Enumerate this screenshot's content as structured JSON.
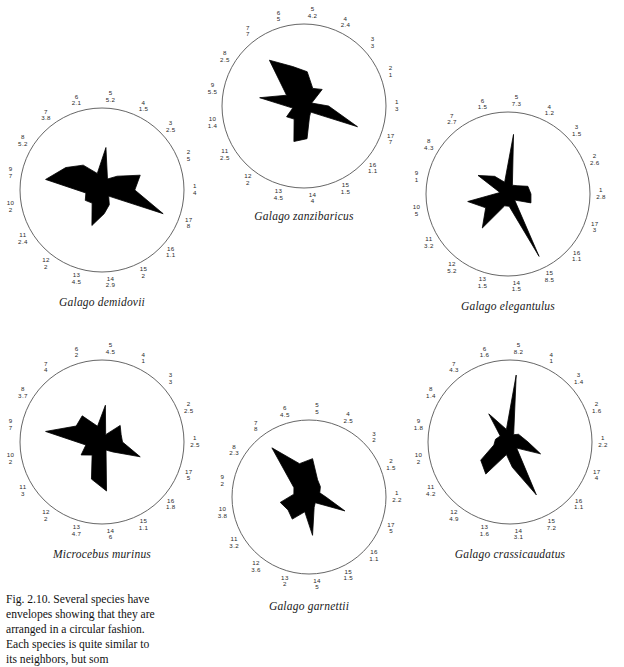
{
  "figure": {
    "caption": "Fig. 2.10. Several species have envelopes showing that they are arranged in a circular fashion. Each species is quite similar to its neighbors, but som"
  },
  "chart_data": [
    {
      "type": "radar",
      "title": "Galago demidovii",
      "spoke_count": 17,
      "rmax": 10,
      "categories": [
        "1",
        "2",
        "3",
        "4",
        "5",
        "6",
        "7",
        "8",
        "9",
        "10",
        "11",
        "12",
        "13",
        "14",
        "15",
        "16",
        "17"
      ],
      "values": [
        4,
        5,
        2.5,
        1.5,
        5.2,
        2.1,
        3.8,
        5.2,
        7,
        2,
        2.4,
        2,
        4.5,
        2.9,
        2,
        1.1,
        8
      ],
      "labels": [
        {
          "idx": "1",
          "val": "4"
        },
        {
          "idx": "2",
          "val": "5"
        },
        {
          "idx": "3",
          "val": "2.5"
        },
        {
          "idx": "4",
          "val": "1.5"
        },
        {
          "idx": "5",
          "val": "5.2"
        },
        {
          "idx": "6",
          "val": "2.1"
        },
        {
          "idx": "7",
          "val": "3.8"
        },
        {
          "idx": "8",
          "val": "5.2"
        },
        {
          "idx": "9",
          "val": "7"
        },
        {
          "idx": "10",
          "val": "2"
        },
        {
          "idx": "11",
          "val": "2.4"
        },
        {
          "idx": "12",
          "val": "2"
        },
        {
          "idx": "13",
          "val": "4.5"
        },
        {
          "idx": "14",
          "val": "2.9"
        },
        {
          "idx": "15",
          "val": "2"
        },
        {
          "idx": "16",
          "val": "1.1"
        },
        {
          "idx": "17",
          "val": "8"
        }
      ]
    },
    {
      "type": "radar",
      "title": "Galago zanzibaricus",
      "spoke_count": 17,
      "rmax": 10,
      "categories": [
        "1",
        "2",
        "3",
        "4",
        "5",
        "6",
        "7",
        "8",
        "9",
        "10",
        "11",
        "12",
        "13",
        "14",
        "15",
        "16",
        "17"
      ],
      "values": [
        3,
        1,
        3,
        2.4,
        4.2,
        5,
        7,
        2.5,
        5.5,
        1.4,
        2.5,
        2,
        4.5,
        4,
        1.5,
        1.1,
        7
      ],
      "labels": [
        {
          "idx": "1",
          "val": "3"
        },
        {
          "idx": "2",
          "val": "1"
        },
        {
          "idx": "3",
          "val": "3"
        },
        {
          "idx": "4",
          "val": "2.4"
        },
        {
          "idx": "5",
          "val": "4.2"
        },
        {
          "idx": "6",
          "val": "5"
        },
        {
          "idx": "7",
          "val": "7"
        },
        {
          "idx": "8",
          "val": "2.5"
        },
        {
          "idx": "9",
          "val": "5.5"
        },
        {
          "idx": "10",
          "val": "1.4"
        },
        {
          "idx": "11",
          "val": "2.5"
        },
        {
          "idx": "12",
          "val": "2"
        },
        {
          "idx": "13",
          "val": "4.5"
        },
        {
          "idx": "14",
          "val": "4"
        },
        {
          "idx": "15",
          "val": "1.5"
        },
        {
          "idx": "16",
          "val": "1.1"
        },
        {
          "idx": "17",
          "val": "7"
        }
      ]
    },
    {
      "type": "radar",
      "title": "Galago elegantulus",
      "spoke_count": 17,
      "rmax": 10,
      "categories": [
        "1",
        "2",
        "3",
        "4",
        "5",
        "6",
        "7",
        "8",
        "9",
        "10",
        "11",
        "12",
        "13",
        "14",
        "15",
        "16",
        "17"
      ],
      "values": [
        2.8,
        2.6,
        1.5,
        1.2,
        7.3,
        1.5,
        2.7,
        4.3,
        1,
        5,
        3.2,
        5.2,
        1.5,
        1.5,
        8.5,
        1.1,
        3
      ],
      "labels": [
        {
          "idx": "1",
          "val": "2.8"
        },
        {
          "idx": "2",
          "val": "2.6"
        },
        {
          "idx": "3",
          "val": "1.5"
        },
        {
          "idx": "4",
          "val": "1.2"
        },
        {
          "idx": "5",
          "val": "7.3"
        },
        {
          "idx": "6",
          "val": "1.5"
        },
        {
          "idx": "7",
          "val": "2.7"
        },
        {
          "idx": "8",
          "val": "4.3"
        },
        {
          "idx": "9",
          "val": "1"
        },
        {
          "idx": "10",
          "val": "5"
        },
        {
          "idx": "11",
          "val": "3.2"
        },
        {
          "idx": "12",
          "val": "5.2"
        },
        {
          "idx": "13",
          "val": "1.5"
        },
        {
          "idx": "14",
          "val": "1.5"
        },
        {
          "idx": "15",
          "val": "8.5"
        },
        {
          "idx": "16",
          "val": "1.1"
        },
        {
          "idx": "17",
          "val": "3"
        }
      ]
    },
    {
      "type": "radar",
      "title": "Microcebus murinus",
      "spoke_count": 17,
      "rmax": 10,
      "categories": [
        "1",
        "2",
        "3",
        "4",
        "5",
        "6",
        "7",
        "8",
        "9",
        "10",
        "11",
        "12",
        "13",
        "14",
        "15",
        "16",
        "17"
      ],
      "values": [
        2.5,
        2.5,
        3,
        1,
        4.5,
        2,
        4,
        3.7,
        7,
        2,
        3,
        2,
        4.7,
        6,
        1.1,
        1.8,
        5
      ],
      "labels": [
        {
          "idx": "1",
          "val": "2.5"
        },
        {
          "idx": "2",
          "val": "2.5"
        },
        {
          "idx": "3",
          "val": "3"
        },
        {
          "idx": "4",
          "val": "1"
        },
        {
          "idx": "5",
          "val": "4.5"
        },
        {
          "idx": "6",
          "val": "2"
        },
        {
          "idx": "7",
          "val": "4"
        },
        {
          "idx": "8",
          "val": "3.7"
        },
        {
          "idx": "9",
          "val": "7"
        },
        {
          "idx": "10",
          "val": "2"
        },
        {
          "idx": "11",
          "val": "3"
        },
        {
          "idx": "12",
          "val": "2"
        },
        {
          "idx": "13",
          "val": "4.7"
        },
        {
          "idx": "14",
          "val": "6"
        },
        {
          "idx": "15",
          "val": "1.1"
        },
        {
          "idx": "16",
          "val": "1.8"
        },
        {
          "idx": "17",
          "val": "5"
        }
      ]
    },
    {
      "type": "radar",
      "title": "Galago garnettii",
      "spoke_count": 17,
      "rmax": 10,
      "categories": [
        "1",
        "2",
        "3",
        "4",
        "5",
        "6",
        "7",
        "8",
        "9",
        "10",
        "11",
        "12",
        "13",
        "14",
        "15",
        "16",
        "17"
      ],
      "values": [
        2.2,
        1.5,
        2,
        2.5,
        5,
        4.5,
        8,
        2.3,
        2,
        3.8,
        3.2,
        3.6,
        2,
        5,
        1.5,
        1.1,
        5
      ],
      "labels": [
        {
          "idx": "1",
          "val": "2.2"
        },
        {
          "idx": "2",
          "val": "1.5"
        },
        {
          "idx": "3",
          "val": "2"
        },
        {
          "idx": "4",
          "val": "2.5"
        },
        {
          "idx": "5",
          "val": "5"
        },
        {
          "idx": "6",
          "val": "4.5"
        },
        {
          "idx": "7",
          "val": "8"
        },
        {
          "idx": "8",
          "val": "2.3"
        },
        {
          "idx": "9",
          "val": "2"
        },
        {
          "idx": "10",
          "val": "3.8"
        },
        {
          "idx": "11",
          "val": "3.2"
        },
        {
          "idx": "12",
          "val": "3.6"
        },
        {
          "idx": "13",
          "val": "2"
        },
        {
          "idx": "14",
          "val": "5"
        },
        {
          "idx": "15",
          "val": "1.5"
        },
        {
          "idx": "16",
          "val": "1.1"
        },
        {
          "idx": "17",
          "val": "5"
        }
      ]
    },
    {
      "type": "radar",
      "title": "Galago crassicaudatus",
      "spoke_count": 17,
      "rmax": 10,
      "categories": [
        "1",
        "2",
        "3",
        "4",
        "5",
        "6",
        "7",
        "8",
        "9",
        "10",
        "11",
        "12",
        "13",
        "14",
        "15",
        "16",
        "17"
      ],
      "values": [
        2.2,
        1.6,
        1.4,
        1,
        8.2,
        1.6,
        4.3,
        1.4,
        1.8,
        2,
        4.2,
        4.9,
        1.6,
        3.1,
        7.2,
        1.1,
        4
      ],
      "labels": [
        {
          "idx": "1",
          "val": "2.2"
        },
        {
          "idx": "2",
          "val": "1.6"
        },
        {
          "idx": "3",
          "val": "1.4"
        },
        {
          "idx": "4",
          "val": "1"
        },
        {
          "idx": "5",
          "val": "8.2"
        },
        {
          "idx": "6",
          "val": "1.6"
        },
        {
          "idx": "7",
          "val": "4.3"
        },
        {
          "idx": "8",
          "val": "1.4"
        },
        {
          "idx": "9",
          "val": "1.8"
        },
        {
          "idx": "10",
          "val": "2"
        },
        {
          "idx": "11",
          "val": "4.2"
        },
        {
          "idx": "12",
          "val": "4.9"
        },
        {
          "idx": "13",
          "val": "1.6"
        },
        {
          "idx": "14",
          "val": "3.1"
        },
        {
          "idx": "15",
          "val": "7.2"
        },
        {
          "idx": "16",
          "val": "1.1"
        },
        {
          "idx": "17",
          "val": "4"
        }
      ]
    }
  ],
  "charts_layout": [
    {
      "left": 4,
      "top": 92,
      "size": 196,
      "name_top": 204
    },
    {
      "left": 206,
      "top": 8,
      "size": 196,
      "name_top": 202
    },
    {
      "left": 410,
      "top": 96,
      "size": 196,
      "name_top": 204
    },
    {
      "left": 4,
      "top": 344,
      "size": 196,
      "name_top": 204
    },
    {
      "left": 216,
      "top": 404,
      "size": 186,
      "name_top": 196
    },
    {
      "left": 412,
      "top": 344,
      "size": 196,
      "name_top": 204
    }
  ]
}
